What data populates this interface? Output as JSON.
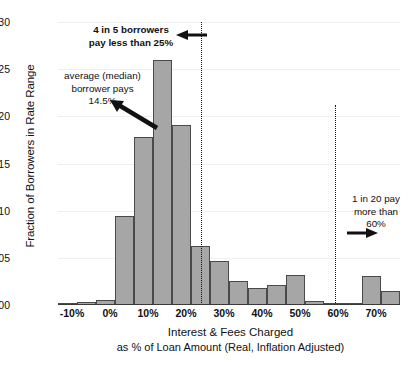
{
  "chart_data": {
    "type": "bar",
    "title": "",
    "xlabel": "Interest & Fees Charged",
    "xlabel_line2": "as % of Loan Amount  (Real, Inflation Adjusted)",
    "ylabel": "Fraction of Borrowers in Rate Range",
    "xlim": [
      -10,
      80
    ],
    "ylim": [
      0.0,
      0.3
    ],
    "bin_width": 5,
    "grid": true,
    "legend": "none",
    "x_tick_labels": [
      "-10%",
      "0%",
      "10%",
      "20%",
      "30%",
      "40%",
      "50%",
      "60%",
      "70%"
    ],
    "x_tick_values": [
      -10,
      0,
      10,
      20,
      30,
      40,
      50,
      60,
      70
    ],
    "y_tick_labels": [
      "0.00",
      "0.05",
      "0.10",
      "0.15",
      "0.20",
      "0.25",
      "0.30"
    ],
    "y_tick_values": [
      0.0,
      0.05,
      0.1,
      0.15,
      0.2,
      0.25,
      0.3
    ],
    "bin_starts": [
      -10,
      -5,
      0,
      5,
      10,
      15,
      20,
      25,
      30,
      35,
      40,
      45,
      50,
      55,
      60,
      65,
      70,
      75
    ],
    "values": [
      0.002,
      0.003,
      0.005,
      0.094,
      0.178,
      0.26,
      0.191,
      0.063,
      0.047,
      0.025,
      0.018,
      0.021,
      0.032,
      0.004,
      0.002,
      0.002,
      0.031,
      0.015
    ],
    "bar_fill": "#a6a6a6",
    "bar_stroke": "#4a4a4a",
    "reference_lines": [
      {
        "name": "pctl-80",
        "x": 27.5,
        "style": "dotted"
      },
      {
        "name": "pctl-95",
        "x": 63.0,
        "style": "dotted"
      }
    ],
    "annotations": [
      {
        "name": "annotation-80th-percentile",
        "text": "4 in 5 borrowers\npay less than 25%",
        "arrow": "left"
      },
      {
        "name": "annotation-median",
        "text": "average (median)\nborrower pays\n14.5%",
        "arrow": "down-right"
      },
      {
        "name": "annotation-95th-percentile",
        "text": "1 in 20 pay\nmore than\n60%",
        "arrow": "right"
      }
    ]
  }
}
